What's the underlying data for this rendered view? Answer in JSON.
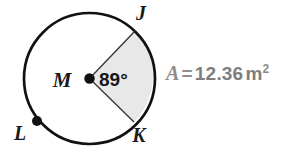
{
  "figure": {
    "type": "circle-sector-diagram",
    "background_color": "#ffffff",
    "stroke_color": "#111111",
    "sector_fill_color": "#e8e8e8",
    "label_color": "#1a1a1a",
    "formula_color": "#8c8c8c"
  },
  "circle": {
    "center_label": "M",
    "center_x": 89.5,
    "center_y": 78.5,
    "radius": 65.5,
    "stroke_width": 2.6
  },
  "points": [
    {
      "id": "point-j",
      "label": "J",
      "x": 135.0,
      "y": 31.0,
      "has_dot": false,
      "label_x": 141,
      "label_y": 20
    },
    {
      "id": "point-k",
      "label": "K",
      "x": 134.0,
      "y": 122.0,
      "has_dot": false,
      "label_x": 139,
      "label_y": 142
    },
    {
      "id": "point-l",
      "label": "L",
      "x": 37.0,
      "y": 121.0,
      "has_dot": true,
      "label_x": 20,
      "label_y": 140
    },
    {
      "id": "point-m",
      "label": "M",
      "x": 89.5,
      "y": 78.5,
      "has_dot": true,
      "label_x": 62,
      "label_y": 87
    }
  ],
  "angle": {
    "label": "89°",
    "value": 89,
    "unit": "degrees",
    "vertex": "M",
    "rays": [
      "MJ",
      "MK"
    ],
    "label_x": 99,
    "label_y": 86
  },
  "sector": {
    "name": "sector-jmk",
    "from_point": "J",
    "to_point": "K",
    "fill": "#e8e8e8"
  },
  "area": {
    "variable": "A",
    "equals": "=",
    "value": "12.36",
    "unit_base": "m",
    "unit_exponent": "2",
    "full_text": "A = 12.36 m²"
  }
}
